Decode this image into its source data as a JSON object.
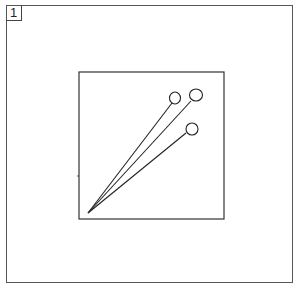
{
  "panel": {
    "number": "1"
  },
  "illustration": {
    "description": "Three pins with round heads inside a square",
    "icon": "pins-icon",
    "stroke_color": "#222222"
  }
}
